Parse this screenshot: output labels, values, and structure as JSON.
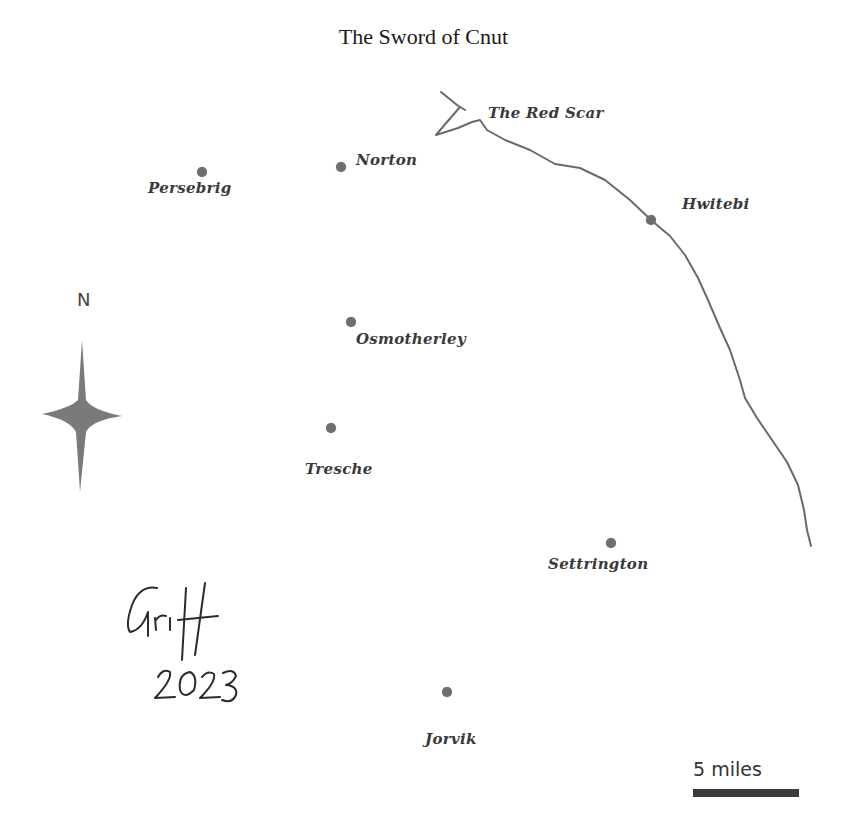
{
  "title": "The Sword of Cnut",
  "river": {
    "label": "The Red Scar",
    "color": "#6a6a6a"
  },
  "compass": {
    "label": "N",
    "color": "#7a7a7a"
  },
  "places": [
    {
      "name": "Persebrig",
      "dot": [
        202,
        172
      ],
      "label": [
        148,
        179
      ]
    },
    {
      "name": "Norton",
      "dot": [
        341,
        167
      ],
      "label": [
        356,
        151
      ]
    },
    {
      "name": "Hwitebi",
      "dot": [
        651,
        220
      ],
      "label": [
        682,
        195
      ]
    },
    {
      "name": "Osmotherley",
      "dot": [
        351,
        322
      ],
      "label": [
        356,
        330
      ]
    },
    {
      "name": "Tresche",
      "dot": [
        331,
        428
      ],
      "label": [
        305,
        460
      ]
    },
    {
      "name": "Settrington",
      "dot": [
        611,
        543
      ],
      "label": [
        548,
        555
      ]
    },
    {
      "name": "Jorvik",
      "dot": [
        447,
        692
      ],
      "label": [
        425,
        730
      ]
    }
  ],
  "signature": {
    "name": "Griff",
    "year": "2023"
  },
  "scale": {
    "label": "5 miles"
  }
}
